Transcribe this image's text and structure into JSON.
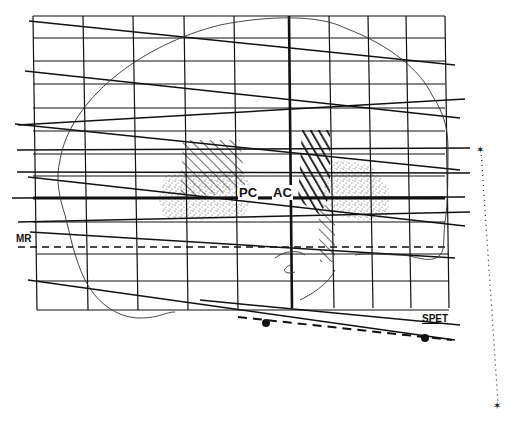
{
  "figure": {
    "labels": {
      "pc": "PC",
      "ac": "AC",
      "mr": "MR",
      "spet": "SPET"
    },
    "grid": {
      "columns": 11,
      "rows": 13,
      "thick_vertical_index": 6
    },
    "markers": {
      "spet_dots": 2,
      "stars": 2
    },
    "colors": {
      "ink": "#111111",
      "background": "#ffffff"
    }
  }
}
